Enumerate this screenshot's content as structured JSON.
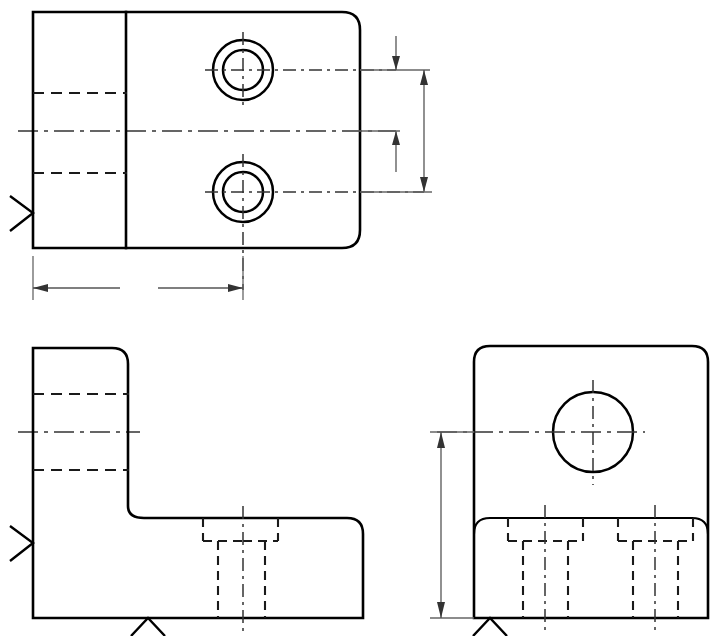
{
  "sheet": {
    "title": "Orthographic Three-View Engineering Drawing",
    "width": 716,
    "height": 636,
    "background_color": "#ffffff",
    "line_color": "#000000",
    "hidden_line_color": "#1a1a1a",
    "center_line_color": "#333333",
    "dimension_line_color": "#555555"
  },
  "views": [
    {
      "id": "top-view",
      "name": "Top View",
      "label": "top-view",
      "outline": {
        "x": 33,
        "y": 12,
        "width": 327,
        "height": 236,
        "corner_radius_top_right": 18,
        "corner_radius_bottom_right": 18
      },
      "internal_edges": [
        {
          "name": "rib-edge-vertical",
          "x1": 126,
          "y1": 12,
          "x2": 126,
          "y2": 248
        }
      ],
      "hidden_edges": [
        {
          "name": "hidden-counterbore-upper",
          "x1": 33,
          "y1": 93,
          "x2": 126,
          "y2": 93
        },
        {
          "name": "hidden-counterbore-lower",
          "x1": 33,
          "y1": 173,
          "x2": 126,
          "y2": 173
        }
      ],
      "center_lines": [
        {
          "name": "horizontal-centerline",
          "x1": 18,
          "y1": 131,
          "x2": 396,
          "y2": 131
        }
      ],
      "holes": [
        {
          "name": "counterbored-hole-upper",
          "center_x": 243,
          "center_y": 70,
          "outer_radius": 30,
          "inner_radius": 20,
          "type": "counterbore"
        },
        {
          "name": "counterbored-hole-lower",
          "center_x": 243,
          "center_y": 192,
          "outer_radius": 30,
          "inner_radius": 20,
          "type": "counterbore"
        }
      ]
    },
    {
      "id": "front-view",
      "name": "Front View",
      "label": "front-view",
      "description": "L-shaped profile with vertical wall on left and horizontal base",
      "vertical_wall": {
        "x": 33,
        "y": 348,
        "width": 95,
        "height": 182
      },
      "base": {
        "x": 33,
        "y": 518,
        "width": 330,
        "height": 100
      },
      "hidden_edges_count": 7,
      "center_lines": [
        {
          "name": "wall-horizontal-centerline",
          "x1": 18,
          "y1": 432,
          "x2": 140,
          "y2": 432
        },
        {
          "name": "hole-vertical-centerline",
          "x1": 243,
          "y1": 508,
          "x2": 243,
          "y2": 630
        }
      ],
      "hidden_counterbore": {
        "name": "counterbore-section",
        "counterbore_left": 203,
        "counterbore_right": 278,
        "counterbore_bottom": 541,
        "hole_left": 218,
        "hole_right": 265,
        "hole_bottom": 618
      }
    },
    {
      "id": "right-side-view",
      "name": "Right Side View",
      "label": "right-side-view",
      "outline": {
        "x": 474,
        "y": 346,
        "width": 234,
        "height": 272,
        "corner_radius": 16
      },
      "step_line": {
        "name": "base-step-line",
        "x1": 474,
        "y1": 518,
        "x2": 708,
        "y2": 518
      },
      "hole": {
        "name": "through-hole",
        "center_x": 593,
        "center_y": 432,
        "radius": 40,
        "type": "through"
      },
      "hidden_counterbores": [
        {
          "name": "counterbore-left",
          "center_x": 545,
          "counterbore_left": 508,
          "counterbore_right": 583,
          "counterbore_bottom": 541,
          "hole_left": 523,
          "hole_right": 568,
          "hole_bottom": 618
        },
        {
          "name": "counterbore-right",
          "center_x": 655,
          "counterbore_left": 618,
          "counterbore_right": 693,
          "counterbore_bottom": 541,
          "hole_left": 633,
          "hole_right": 678,
          "hole_bottom": 618
        }
      ],
      "center_lines": [
        {
          "name": "hole-horizontal-centerline",
          "x1": 437,
          "y1": 432,
          "x2": 645,
          "y2": 432
        },
        {
          "name": "hole-vertical-centerline",
          "x1": 593,
          "y1": 380,
          "x2": 593,
          "y2": 485
        },
        {
          "name": "counterbore-left-centerline",
          "x1": 545,
          "y1": 505,
          "x2": 545,
          "y2": 632
        },
        {
          "name": "counterbore-right-centerline",
          "x1": 655,
          "y1": 505,
          "x2": 655,
          "y2": 632
        }
      ]
    }
  ],
  "dimensions": [
    {
      "id": "dim-top-vertical-inner",
      "name": "dimension-hole-to-centerline",
      "orientation": "vertical",
      "value_label": "",
      "x": 396,
      "y_start": 70,
      "y_end": 131,
      "arrow_positions": [
        "top-outside",
        "bottom-inside"
      ]
    },
    {
      "id": "dim-top-vertical-outer",
      "name": "dimension-hole-spacing",
      "orientation": "vertical",
      "value_label": "",
      "x": 424,
      "y_start": 70,
      "y_end": 192,
      "arrow_positions": [
        "top-inside",
        "bottom-inside"
      ]
    },
    {
      "id": "dim-top-horizontal",
      "name": "dimension-edge-to-hole",
      "orientation": "horizontal",
      "value_label": "",
      "y": 288,
      "x_start": 33,
      "x_end": 243,
      "arrow_positions": [
        "left-inside",
        "right-inside"
      ]
    },
    {
      "id": "dim-side-vertical",
      "name": "dimension-hole-height",
      "orientation": "vertical",
      "value_label": "",
      "x": 441,
      "y_start": 432,
      "y_end": 618,
      "arrow_positions": [
        "top-inside",
        "bottom-inside"
      ]
    }
  ],
  "view_direction_arrows": [
    {
      "id": "arrow-top-view-left",
      "name": "view-direction-arrow-right",
      "glyph": ">",
      "x": 33,
      "y": 213,
      "direction": "right"
    },
    {
      "id": "arrow-front-view-left",
      "name": "view-direction-arrow-right",
      "glyph": ">",
      "x": 33,
      "y": 543,
      "direction": "right"
    },
    {
      "id": "arrow-front-view-bottom",
      "name": "view-direction-arrow-up",
      "glyph": "^",
      "x": 148,
      "y": 618,
      "direction": "up"
    },
    {
      "id": "arrow-side-view-bottom",
      "name": "view-direction-arrow-up",
      "glyph": "^",
      "x": 490,
      "y": 618,
      "direction": "up"
    }
  ]
}
